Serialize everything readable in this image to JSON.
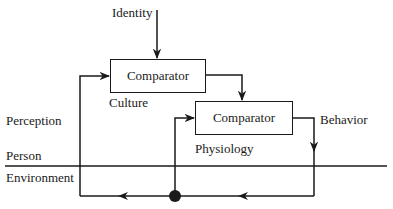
{
  "diagram": {
    "inputs": {
      "identity": "Identity"
    },
    "nodes": [
      {
        "id": "comparator-culture",
        "label": "Comparator",
        "sublabel": "Culture"
      },
      {
        "id": "comparator-physiology",
        "label": "Comparator",
        "sublabel": "Physiology"
      }
    ],
    "outputs": {
      "behavior": "Behavior"
    },
    "side_labels": {
      "perception": "Perception",
      "person": "Person",
      "environment": "Environment"
    },
    "colors": {
      "stroke": "#1a1a1a",
      "background": "#ffffff"
    }
  }
}
